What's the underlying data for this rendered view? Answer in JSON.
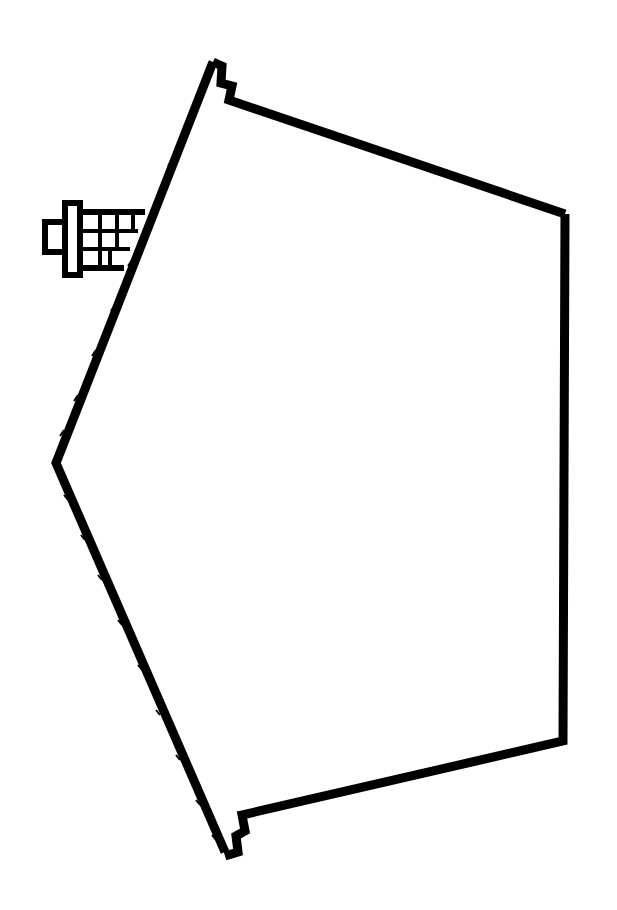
{
  "figure": {
    "stroke_color": "#000000",
    "background_color": "#ffffff",
    "parts": [
      "roof-outline",
      "wall-outline",
      "chimney"
    ]
  }
}
